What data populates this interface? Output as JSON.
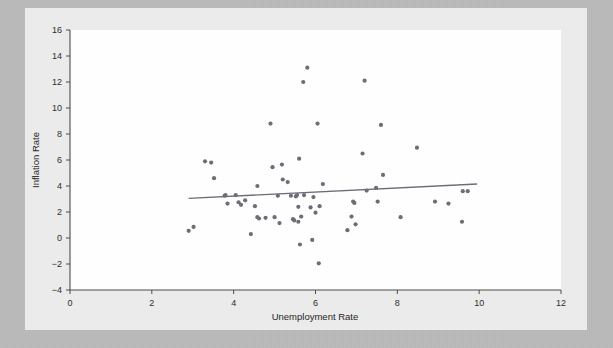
{
  "figure": {
    "background_color": "#b9b9b9",
    "panel_color": "#ececec",
    "plot_area_color": "#ffffff"
  },
  "chart_data": {
    "type": "scatter",
    "title": "",
    "xlabel": "Unemployment Rate",
    "ylabel": "Inflation Rate",
    "xlim": [
      0,
      12
    ],
    "ylim": [
      -4,
      16
    ],
    "xticks": [
      0,
      2,
      4,
      6,
      8,
      10,
      12
    ],
    "yticks": [
      -4,
      -2,
      0,
      2,
      4,
      6,
      8,
      10,
      12,
      14,
      16
    ],
    "xtick_labels": [
      "0",
      "2",
      "4",
      "6",
      "8",
      "10",
      "12"
    ],
    "ytick_labels": [
      "-4",
      "-2",
      "0",
      "2",
      "4",
      "6",
      "8",
      "10",
      "12",
      "14",
      "16"
    ],
    "grid": false,
    "legend": null,
    "marker_color": "#6c6c78",
    "marker_size": 3,
    "trend_line": {
      "color": "#6b6b76",
      "x_start": 2.9,
      "y_start": 3.05,
      "x_end": 9.95,
      "y_end": 4.15
    },
    "points": [
      {
        "x": 2.9,
        "y": 0.55
      },
      {
        "x": 3.02,
        "y": 0.85
      },
      {
        "x": 3.3,
        "y": 5.9
      },
      {
        "x": 3.45,
        "y": 5.8
      },
      {
        "x": 3.52,
        "y": 4.6
      },
      {
        "x": 3.78,
        "y": 3.25
      },
      {
        "x": 3.8,
        "y": 3.3
      },
      {
        "x": 3.85,
        "y": 2.65
      },
      {
        "x": 4.05,
        "y": 3.3
      },
      {
        "x": 4.12,
        "y": 2.75
      },
      {
        "x": 4.18,
        "y": 2.55
      },
      {
        "x": 4.28,
        "y": 2.9
      },
      {
        "x": 4.42,
        "y": 0.3
      },
      {
        "x": 4.52,
        "y": 2.45
      },
      {
        "x": 4.58,
        "y": 4.0
      },
      {
        "x": 4.58,
        "y": 1.6
      },
      {
        "x": 4.62,
        "y": 1.5
      },
      {
        "x": 4.78,
        "y": 1.55
      },
      {
        "x": 4.9,
        "y": 8.8
      },
      {
        "x": 4.95,
        "y": 5.45
      },
      {
        "x": 5.0,
        "y": 1.6
      },
      {
        "x": 5.08,
        "y": 3.25
      },
      {
        "x": 5.12,
        "y": 1.15
      },
      {
        "x": 5.18,
        "y": 5.65
      },
      {
        "x": 5.2,
        "y": 4.5
      },
      {
        "x": 5.32,
        "y": 4.3
      },
      {
        "x": 5.4,
        "y": 3.25
      },
      {
        "x": 5.45,
        "y": 1.45
      },
      {
        "x": 5.48,
        "y": 1.35
      },
      {
        "x": 5.52,
        "y": 3.2
      },
      {
        "x": 5.55,
        "y": 3.3
      },
      {
        "x": 5.58,
        "y": 2.4
      },
      {
        "x": 5.58,
        "y": 1.25
      },
      {
        "x": 5.6,
        "y": 6.1
      },
      {
        "x": 5.62,
        "y": -0.5
      },
      {
        "x": 5.65,
        "y": 1.65
      },
      {
        "x": 5.7,
        "y": 12.0
      },
      {
        "x": 5.72,
        "y": 3.3
      },
      {
        "x": 5.8,
        "y": 13.1
      },
      {
        "x": 5.88,
        "y": 2.35
      },
      {
        "x": 5.92,
        "y": -0.15
      },
      {
        "x": 5.95,
        "y": 3.15
      },
      {
        "x": 6.0,
        "y": 1.95
      },
      {
        "x": 6.05,
        "y": 8.8
      },
      {
        "x": 6.08,
        "y": -1.95
      },
      {
        "x": 6.1,
        "y": 2.45
      },
      {
        "x": 6.18,
        "y": 4.15
      },
      {
        "x": 6.78,
        "y": 0.6
      },
      {
        "x": 6.88,
        "y": 1.65
      },
      {
        "x": 6.92,
        "y": 2.8
      },
      {
        "x": 6.95,
        "y": 2.7
      },
      {
        "x": 6.98,
        "y": 1.05
      },
      {
        "x": 7.15,
        "y": 6.5
      },
      {
        "x": 7.2,
        "y": 12.1
      },
      {
        "x": 7.25,
        "y": 3.65
      },
      {
        "x": 7.48,
        "y": 3.85
      },
      {
        "x": 7.52,
        "y": 2.8
      },
      {
        "x": 7.6,
        "y": 8.7
      },
      {
        "x": 7.65,
        "y": 4.85
      },
      {
        "x": 8.08,
        "y": 1.6
      },
      {
        "x": 8.48,
        "y": 6.95
      },
      {
        "x": 8.92,
        "y": 2.8
      },
      {
        "x": 9.25,
        "y": 2.65
      },
      {
        "x": 9.58,
        "y": 1.25
      },
      {
        "x": 9.6,
        "y": 3.6
      },
      {
        "x": 9.72,
        "y": 3.6
      }
    ]
  }
}
